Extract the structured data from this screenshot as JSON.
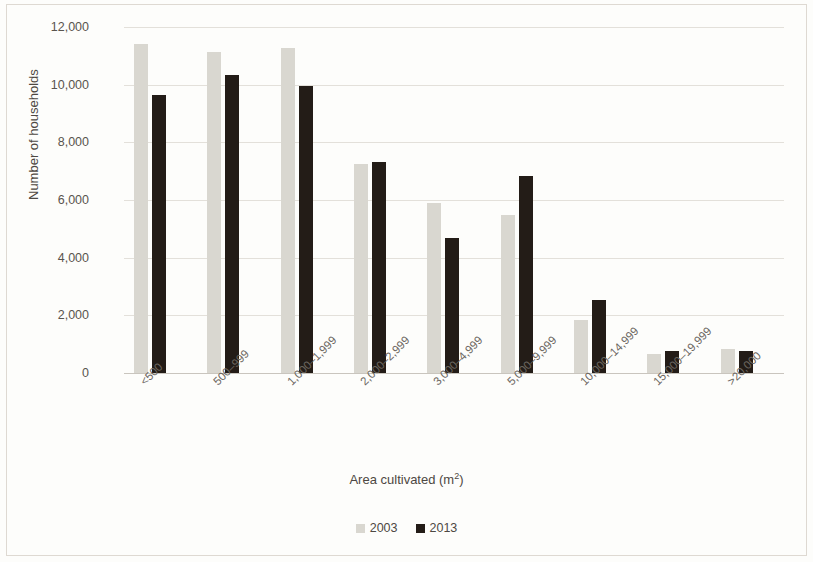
{
  "chart_data": {
    "type": "bar",
    "title": "",
    "xlabel": "Area cultivated (m²)",
    "xlabel_base": "Area cultivated (m",
    "xlabel_sup": "2",
    "xlabel_close": ")",
    "ylabel": "Number of households",
    "ylim": [
      0,
      12000
    ],
    "ytick_step": 2000,
    "yticks": [
      "0",
      "2,000",
      "4,000",
      "6,000",
      "8,000",
      "10,000",
      "12,000"
    ],
    "ytick_values": [
      0,
      2000,
      4000,
      6000,
      8000,
      10000,
      12000
    ],
    "grid": true,
    "legend_position": "bottom",
    "categories": [
      "<500",
      "500–999",
      "1,000–1,999",
      "2,000–2,999",
      "3,000–4,999",
      "5,000–9,999",
      "10,000–14,999",
      "15,000–19,999",
      ">20,000"
    ],
    "series": [
      {
        "name": "2003",
        "color": "#d9d7d0",
        "values": [
          11400,
          11130,
          11270,
          7250,
          5900,
          5480,
          1840,
          650,
          820
        ]
      },
      {
        "name": "2013",
        "color": "#231c17",
        "values": [
          9640,
          10340,
          9950,
          7320,
          4680,
          6840,
          2530,
          770,
          760
        ]
      }
    ]
  }
}
